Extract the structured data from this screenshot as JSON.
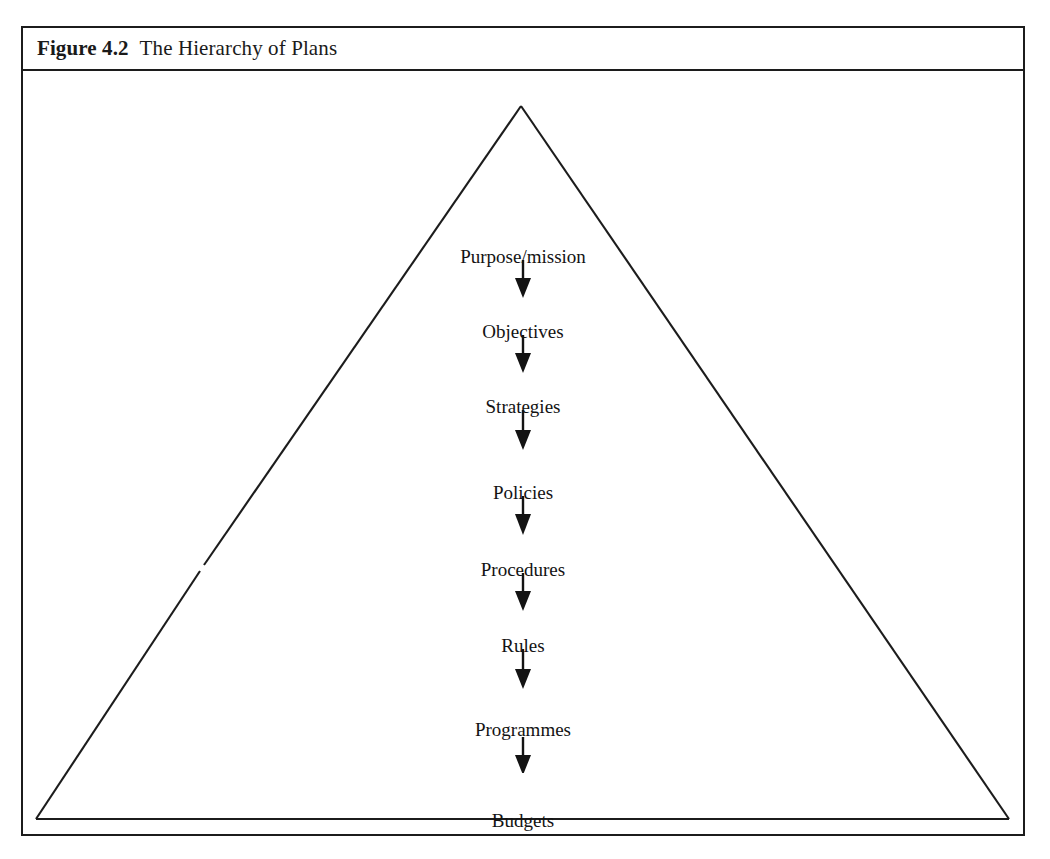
{
  "figure": {
    "number": "Figure 4.2",
    "title": "The Hierarchy of Plans"
  },
  "diagram": {
    "shape": "triangle",
    "shape_name": "hierarchy-pyramid",
    "line_color": "#1c1c1c",
    "text_color": "#131313",
    "background": "#ffffff",
    "arrow_glyph": "down-arrow",
    "levels": [
      {
        "label": "Purpose/mission",
        "y": 176
      },
      {
        "label": "Objectives",
        "y": 251
      },
      {
        "label": "Strategies",
        "y": 326
      },
      {
        "label": "Policies",
        "y": 412
      },
      {
        "label": "Procedures",
        "y": 489
      },
      {
        "label": "Rules",
        "y": 565
      },
      {
        "label": "Programmes",
        "y": 649
      },
      {
        "label": "Budgets",
        "y": 740
      }
    ],
    "arrows": [
      {
        "y": 189
      },
      {
        "y": 264
      },
      {
        "y": 339
      },
      {
        "y": 425
      },
      {
        "y": 502
      },
      {
        "y": 578
      },
      {
        "y": 662
      }
    ]
  }
}
